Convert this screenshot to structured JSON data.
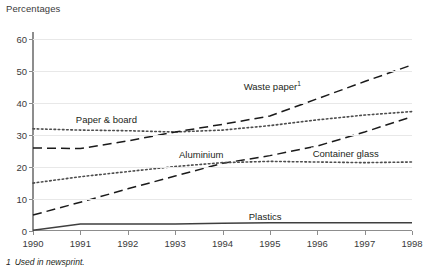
{
  "chart_data": {
    "type": "line",
    "title": "",
    "ylabel": "Percentages",
    "xlabel": "",
    "x": [
      1990,
      1991,
      1992,
      1993,
      1994,
      1995,
      1996,
      1997,
      1998
    ],
    "xtick_labels": [
      "1990",
      "1991",
      "1992",
      "1993",
      "1994",
      "1995",
      "1996",
      "1997",
      "1998"
    ],
    "ytick_labels": [
      "0",
      "10",
      "20",
      "30",
      "40",
      "50",
      "60"
    ],
    "yticks": [
      0,
      10,
      20,
      30,
      40,
      50,
      60
    ],
    "ylim": [
      0,
      62
    ],
    "xlim": [
      1990,
      1998
    ],
    "grid": "horizontal",
    "legend": "inline-labels",
    "series": [
      {
        "name": "Paper & board",
        "style": "dotted",
        "color": "#4d4d4d",
        "label": "Paper & board",
        "label_x": 1991.55,
        "label_y": 35.2,
        "values": [
          32.0,
          31.6,
          31.4,
          31.0,
          31.6,
          33.0,
          34.8,
          36.3,
          37.4
        ]
      },
      {
        "name": "Waste paper",
        "style": "dashed",
        "color": "#1a1a1a",
        "label": "Waste paper",
        "label_footnote": "1",
        "label_x": 1995.05,
        "label_y": 45.5,
        "values": [
          26.0,
          25.8,
          28.2,
          31.0,
          33.4,
          36.0,
          41.4,
          46.8,
          52.0
        ]
      },
      {
        "name": "Aluminium",
        "style": "dashed",
        "color": "#1a1a1a",
        "label": "Aluminium",
        "label_x": 1993.55,
        "label_y": 24.0,
        "values": [
          5.0,
          9.0,
          13.2,
          17.2,
          21.2,
          23.6,
          26.6,
          31.0,
          35.8
        ]
      },
      {
        "name": "Container glass",
        "style": "dotted",
        "color": "#4d4d4d",
        "label": "Container glass",
        "label_x": 1996.6,
        "label_y": 24.4,
        "values": [
          15.0,
          17.0,
          18.6,
          20.2,
          21.4,
          21.8,
          21.6,
          21.4,
          21.6
        ]
      },
      {
        "name": "Plastics",
        "style": "solid",
        "color": "#3f3f3f",
        "label": "Plastics",
        "label_x": 1994.9,
        "label_y": 4.6,
        "values": [
          0.2,
          2.2,
          2.2,
          2.2,
          2.4,
          2.6,
          2.6,
          2.6,
          2.6
        ]
      }
    ],
    "footnote": {
      "marker": "1",
      "text": "Used in newsprint."
    }
  }
}
